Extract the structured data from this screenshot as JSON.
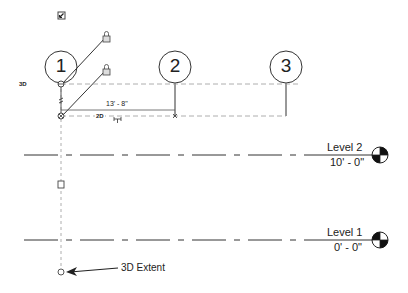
{
  "grids": [
    {
      "label": "1",
      "cx": 61,
      "cy": 67
    },
    {
      "label": "2",
      "cx": 175,
      "cy": 67
    },
    {
      "label": "3",
      "cx": 286,
      "cy": 67
    }
  ],
  "levels": [
    {
      "name": "Level 2",
      "elevation": "10' - 0\"",
      "y": 155
    },
    {
      "name": "Level 1",
      "elevation": "0' - 0\"",
      "y": 240
    }
  ],
  "dimension": {
    "value": "13' - 8\""
  },
  "tags": {
    "three_d_left": "3D",
    "two_d_mid": "2D"
  },
  "annotation": {
    "text": "3D Extent"
  },
  "colors": {
    "line": "#333333",
    "dashed": "#9a9a9a",
    "target_fill": "#111111"
  }
}
